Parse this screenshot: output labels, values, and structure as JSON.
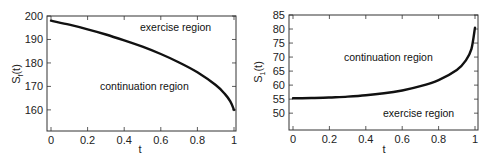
{
  "chart_data": [
    {
      "type": "line",
      "title": "",
      "xlabel": "t",
      "ylabel": "S_f(t)",
      "ylabel_main": "S",
      "ylabel_sub": "f",
      "ylabel_tail": "(t)",
      "xlim": [
        0,
        1
      ],
      "ylim": [
        151,
        200
      ],
      "xticks": [
        "0",
        "0.2",
        "0.4",
        "0.6",
        "0.8",
        "1"
      ],
      "yticks": [
        "160",
        "170",
        "180",
        "190",
        "200"
      ],
      "grid": false,
      "annotations": [
        "exercise region",
        "continuation region"
      ],
      "series": [
        {
          "name": "optimal exercise boundary",
          "x": [
            0,
            0.1,
            0.2,
            0.3,
            0.4,
            0.5,
            0.6,
            0.7,
            0.8,
            0.9,
            0.95,
            0.98,
            1.0
          ],
          "values": [
            198,
            196.3,
            194.3,
            192.1,
            189.6,
            186.9,
            183.8,
            180.2,
            176,
            170.6,
            166.8,
            163.6,
            160
          ]
        }
      ]
    },
    {
      "type": "line",
      "title": "",
      "xlabel": "t",
      "ylabel": "S_1(t)",
      "ylabel_main": "S",
      "ylabel_sub": "1",
      "ylabel_tail": "(t)",
      "xlim": [
        0,
        1
      ],
      "ylim": [
        44,
        85
      ],
      "xticks": [
        "0",
        "0.2",
        "0.4",
        "0.6",
        "0.8",
        "1"
      ],
      "yticks": [
        "50",
        "55",
        "60",
        "65",
        "70",
        "75",
        "80",
        "85"
      ],
      "grid": false,
      "annotations": [
        "continuation region",
        "exercise region"
      ],
      "series": [
        {
          "name": "optimal exercise boundary",
          "x": [
            0,
            0.1,
            0.2,
            0.3,
            0.4,
            0.5,
            0.6,
            0.7,
            0.8,
            0.9,
            0.95,
            0.98,
            1.0
          ],
          "values": [
            55.3,
            55.4,
            55.6,
            55.9,
            56.4,
            57.1,
            58.1,
            59.6,
            61.8,
            65.4,
            68.8,
            72.8,
            80.5
          ]
        }
      ]
    }
  ]
}
